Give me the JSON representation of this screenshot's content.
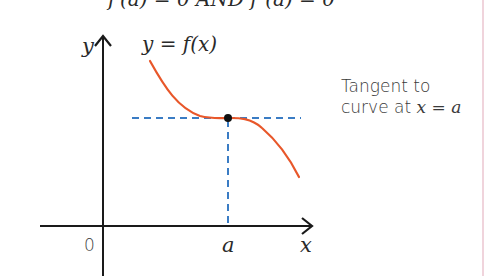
{
  "header": {
    "text": "f′(a) = 0 AND f″(a) = 0"
  },
  "axes": {
    "y_label": "y",
    "x_label": "x",
    "origin_label": "0",
    "x_marker_label": "a"
  },
  "curve": {
    "label": "y = f(x)",
    "color": "#e8572a"
  },
  "tangent": {
    "color": "#3a7cc4",
    "annotation_line1": "Tangent to",
    "annotation_line2_prefix": "curve at ",
    "annotation_line2_math": "x = a"
  },
  "colors": {
    "axis": "#1a1a1a",
    "point": "#111111",
    "edge_line": "#f0d4dc"
  }
}
